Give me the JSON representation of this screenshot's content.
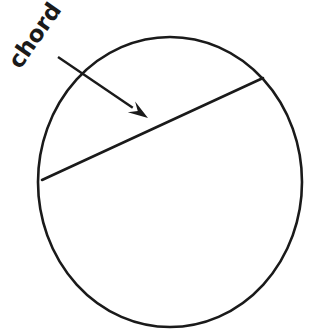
{
  "figure": {
    "title": "chord",
    "background_color": "#ffffff",
    "ink_color": "#1a1a1a",
    "width": 323,
    "height": 333
  },
  "labels": {
    "chord": "chord",
    "chord_rotation_deg": -55,
    "chord_font_size": 23,
    "chord_anchor_x": 20,
    "chord_anchor_y": 70
  },
  "shapes": {
    "circle": {
      "name": "circle",
      "center_x": 170,
      "center_y": 182,
      "radius_x": 132,
      "radius_y": 145,
      "stroke_width": 2.6,
      "fill": "none"
    },
    "chord_line": {
      "name": "chord-line",
      "x1": 42,
      "y1": 180,
      "x2": 263,
      "y2": 78,
      "stroke_width": 2.6
    },
    "arrow": {
      "name": "pointer-arrow",
      "tail_x": 58,
      "tail_y": 57,
      "tip_x": 148,
      "tip_y": 118,
      "stroke_width": 2.4,
      "head_length": 20,
      "head_width": 13
    }
  }
}
